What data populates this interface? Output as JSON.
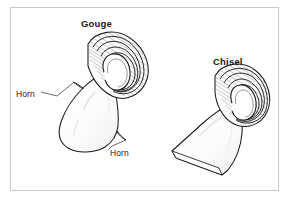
{
  "figure": {
    "title_gouge": "Gouge",
    "title_chisel": "Chisel",
    "callout_horn_left": "Horn",
    "callout_horn_right": "Horn",
    "caption_partial": "",
    "colors": {
      "background": "#ffffff",
      "frame_border": "#c9c9c9",
      "ink": "#1a1a1a",
      "hatch": "#6e6e6e",
      "leader_line": "#3a3a3a",
      "fill_light": "#fdfdfd",
      "fill_shade": "#f1f1f1"
    }
  }
}
